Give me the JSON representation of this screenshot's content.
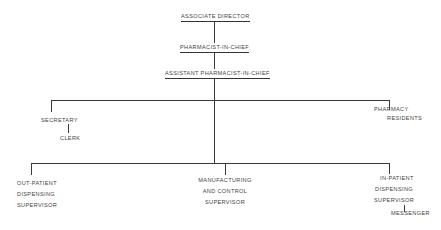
{
  "diagram": {
    "type": "org-chart",
    "nodes": {
      "associate_director": "ASSOCIATE DIRECTOR",
      "pharmacist_in_chief": "PHARMACIST-IN-CHIEF",
      "assistant_pharmacist_in_chief": "ASSISTANT PHARMACIST-IN-CHIEF",
      "secretary": "SECRETARY",
      "clerk": "CLERK",
      "pharmacy_residents": [
        "PHARMACY",
        "RESIDENTS"
      ],
      "outpatient_supervisor": [
        "OUT-PATIENT",
        "DISPENSING",
        "SUPERVISOR"
      ],
      "manufacturing_supervisor": [
        "MANUFACTURING",
        "AND CONTROL",
        "SUPERVISOR"
      ],
      "inpatient_supervisor": [
        "IN-PATIENT",
        "DISPENSING",
        "SUPERVISOR"
      ],
      "messenger": "MESSENGER"
    },
    "edges": [
      [
        "associate_director",
        "pharmacist_in_chief"
      ],
      [
        "pharmacist_in_chief",
        "assistant_pharmacist_in_chief"
      ],
      [
        "assistant_pharmacist_in_chief",
        "secretary"
      ],
      [
        "assistant_pharmacist_in_chief",
        "pharmacy_residents"
      ],
      [
        "secretary",
        "clerk"
      ],
      [
        "assistant_pharmacist_in_chief",
        "outpatient_supervisor"
      ],
      [
        "assistant_pharmacist_in_chief",
        "manufacturing_supervisor"
      ],
      [
        "assistant_pharmacist_in_chief",
        "inpatient_supervisor"
      ],
      [
        "inpatient_supervisor",
        "messenger"
      ]
    ]
  }
}
